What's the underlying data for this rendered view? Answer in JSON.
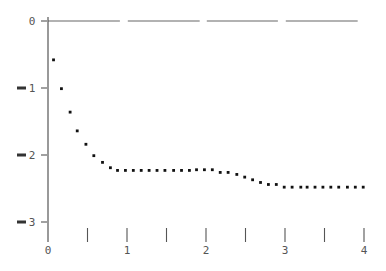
{
  "chart_data": {
    "type": "scatter",
    "title": "",
    "xlabel": "",
    "ylabel": "",
    "xlim": [
      0,
      4
    ],
    "ylim": [
      -3.3,
      0.1
    ],
    "grid": false,
    "legend": null,
    "x_ticks": [
      0,
      0.5,
      1,
      1.5,
      2,
      2.5,
      3,
      3.5,
      4
    ],
    "x_tick_labels": [
      "0",
      "",
      "1",
      "",
      "2",
      "",
      "3",
      "",
      "4"
    ],
    "y_ticks": [
      0,
      -1,
      -2,
      -3
    ],
    "y_tick_labels": [
      "0",
      "-1",
      "-2",
      "-3"
    ],
    "reference_line": {
      "y": 0,
      "style": "long-dash"
    },
    "series": [
      {
        "name": "data",
        "x": [
          0.07,
          0.17,
          0.28,
          0.37,
          0.48,
          0.58,
          0.69,
          0.79,
          0.88,
          0.98,
          1.08,
          1.18,
          1.28,
          1.38,
          1.48,
          1.59,
          1.69,
          1.79,
          1.88,
          1.98,
          2.08,
          2.18,
          2.28,
          2.39,
          2.49,
          2.59,
          2.69,
          2.79,
          2.89,
          2.99,
          3.09,
          3.2,
          3.28,
          3.38,
          3.48,
          3.58,
          3.68,
          3.79,
          3.89,
          3.99
        ],
        "y": [
          -0.58,
          -1.01,
          -1.36,
          -1.64,
          -1.84,
          -2.01,
          -2.11,
          -2.19,
          -2.23,
          -2.23,
          -2.23,
          -2.23,
          -2.23,
          -2.23,
          -2.23,
          -2.23,
          -2.23,
          -2.23,
          -2.22,
          -2.22,
          -2.22,
          -2.26,
          -2.26,
          -2.29,
          -2.33,
          -2.37,
          -2.41,
          -2.44,
          -2.44,
          -2.48,
          -2.48,
          -2.48,
          -2.48,
          -2.48,
          -2.48,
          -2.48,
          -2.48,
          -2.48,
          -2.48,
          -2.48
        ]
      }
    ]
  },
  "layout": {
    "x0_px": 48,
    "x_scale": 79,
    "y0_px": 21,
    "y_scale": 67,
    "y_axis_bottom_px": 242,
    "x_tick_top_px": 228,
    "x_tick_bottom_px": 242,
    "x_label_y_px": 254
  }
}
